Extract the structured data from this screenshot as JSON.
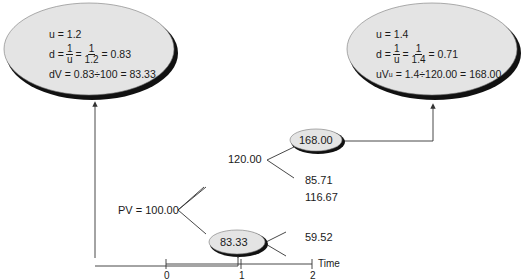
{
  "diagram": {
    "type": "binomial-tree",
    "colors": {
      "node_fill": "#e4e4e4",
      "node_shadow": "#111111",
      "line": "#333333",
      "text": "#1a1a1a"
    },
    "left_callout": {
      "u_line": "u = 1.2",
      "d_prefix": "d =",
      "frac1_num": "1",
      "frac1_den": "u",
      "eq": "=",
      "frac2_num": "1",
      "frac2_den": "1.2",
      "d_result": "= 0.83",
      "dv_line": "dV = 0.83÷100 = 83.33"
    },
    "right_callout": {
      "u_line": "u = 1.4",
      "d_prefix": "d =",
      "frac1_num": "1",
      "frac1_den": "u",
      "eq": "=",
      "frac2_num": "1",
      "frac2_den": "1.4",
      "d_result": "= 0.71",
      "uv_prefix": "uV",
      "uv_sub": "u",
      "uv_rest": " = 1.4÷120.00 = 168.00"
    },
    "nodes": {
      "root": "PV = 100.00",
      "up1": "120.00",
      "down1": "83.33",
      "uu": "168.00",
      "ud": "85.71",
      "du": "116.67",
      "dd": "59.52"
    },
    "timeline": {
      "ticks": [
        "0",
        "1",
        "2"
      ],
      "label": "Time"
    }
  }
}
